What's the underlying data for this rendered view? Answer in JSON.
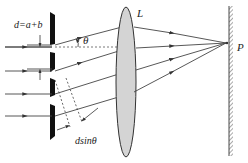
{
  "diagram": {
    "type": "diffraction-grating",
    "labels": {
      "grating_constant": "d=a+b",
      "angle": "θ",
      "lens": "L",
      "point": "P",
      "path_difference": "dsinθ"
    },
    "colors": {
      "line": "#444444",
      "grating": "#111111",
      "lens_fill": "#d4d4d4",
      "background": "#ffffff"
    }
  }
}
